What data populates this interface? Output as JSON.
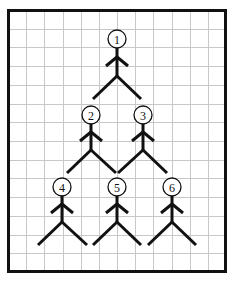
{
  "diagram": {
    "type": "stick-figure pyramid on grid",
    "colors": {
      "background": "#ffffff",
      "grid": "#c8c8c8",
      "ink": "#111111"
    },
    "grid": {
      "columns": 12,
      "rows": 14
    },
    "figures": [
      {
        "label": "1",
        "row": 1
      },
      {
        "label": "2",
        "row": 2
      },
      {
        "label": "3",
        "row": 2
      },
      {
        "label": "4",
        "row": 3
      },
      {
        "label": "5",
        "row": 3
      },
      {
        "label": "6",
        "row": 3
      }
    ]
  }
}
